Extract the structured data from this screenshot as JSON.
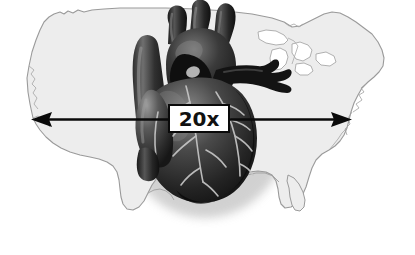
{
  "figure": {
    "background_color": "#ffffff",
    "width": 415,
    "height": 255
  },
  "map": {
    "name": "united-states-outline",
    "fill_color": "#ededed",
    "stroke_color": "#9a9a9a",
    "shadow_color": "#d8d8d8"
  },
  "heart": {
    "name": "anatomical-heart-illustration",
    "body_dark": "#1c1c1c",
    "body_mid": "#3d3d3d",
    "body_light": "#6e6e6e",
    "highlight": "#b9b9b9",
    "vessel_dark": "#0d0d0d",
    "artery_color": "#cfcfcf"
  },
  "measurement": {
    "name": "span-arrow",
    "label": "20x",
    "line_color": "#0a0a0a",
    "line_y": 119,
    "start_x": 32,
    "end_x": 351,
    "box_border_color": "#0a0a0a",
    "box_fill_color": "#ffffff"
  }
}
